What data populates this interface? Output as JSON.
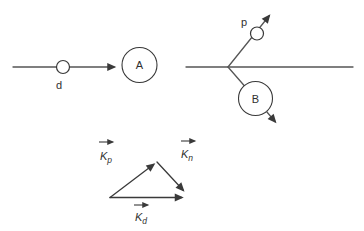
{
  "figure": {
    "background": "#ffffff",
    "line_color": "#565656",
    "ink_color": "#323232",
    "before_collision": {
      "projectile_label": "d",
      "target_nucleus_label": "A"
    },
    "after_collision": {
      "ejected_particle_label": "p",
      "recoil_nucleus_label": "B"
    },
    "momentum_triangle": {
      "kp": {
        "base": "K",
        "sub": "p"
      },
      "kn": {
        "base": "K",
        "sub": "n"
      },
      "kd": {
        "base": "K",
        "sub": "d"
      }
    }
  }
}
